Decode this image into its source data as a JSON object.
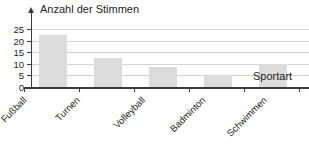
{
  "chart_data": {
    "type": "bar",
    "title": "",
    "xlabel": "Sportart",
    "ylabel": "Anzahl der Stimmen",
    "categories": [
      "Fußball",
      "Turnen",
      "Volleyball",
      "Badminton",
      "Schwimmen"
    ],
    "values": [
      22.5,
      12.5,
      8.5,
      5,
      10
    ],
    "yticks": [
      "0",
      "5",
      "10",
      "15",
      "20",
      "25"
    ],
    "ylim": [
      0,
      25
    ],
    "grid": true,
    "legend": "none",
    "bar_color": "#dcdcdc",
    "axis_color": "#3b3b3b",
    "grid_color": "#d4d4d4"
  }
}
